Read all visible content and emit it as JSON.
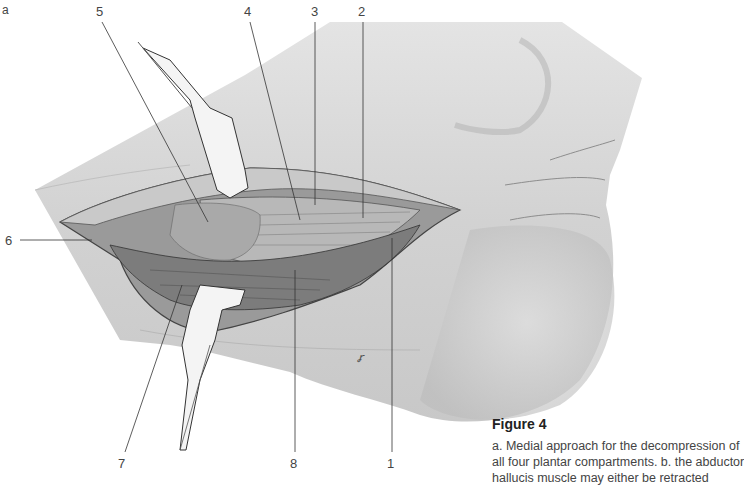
{
  "figure": {
    "panel_label": "a",
    "title": "Figure 4",
    "caption_lines": [
      "a. Medial approach for the decompression of",
      "all four plantar compartments. b. the abductor",
      "hallucis muscle may either be retracted"
    ],
    "illustration": "medial-foot-incision-with-retractors",
    "signature": "℞"
  },
  "callouts": [
    {
      "number": "5",
      "x": 96,
      "y": 6
    },
    {
      "number": "4",
      "x": 244,
      "y": 6
    },
    {
      "number": "3",
      "x": 311,
      "y": 6
    },
    {
      "number": "2",
      "x": 358,
      "y": 6
    },
    {
      "number": "6",
      "x": 5,
      "y": 234
    },
    {
      "number": "7",
      "x": 118,
      "y": 457
    },
    {
      "number": "8",
      "x": 290,
      "y": 457
    },
    {
      "number": "1",
      "x": 385,
      "y": 457
    }
  ],
  "colors": {
    "skin": "#d6d6d6",
    "skin_shadow": "#b5b5b5",
    "wound": "#8a8a8a",
    "retractor": "#f2f2f2",
    "leader_line": "#333333"
  }
}
